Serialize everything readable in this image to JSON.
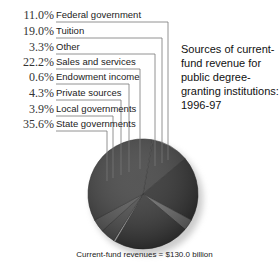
{
  "chart_data": {
    "type": "pie",
    "footer": "Current-fund revenues = $130.0 billion",
    "total": "$130.0 billion",
    "unit": "%",
    "categories": [
      "Federal government",
      "Tuition",
      "Other",
      "Sales and services",
      "Endowment income",
      "Private sources",
      "Local governments",
      "State governments"
    ],
    "values": [
      11.0,
      19.0,
      3.3,
      22.2,
      0.6,
      4.3,
      3.9,
      35.6
    ],
    "labels": [
      "11.0%",
      "19.0%",
      "3.3%",
      "22.2%",
      "0.6%",
      "4.3%",
      "3.9%",
      "35.6%"
    ],
    "legend_position": "left, with leader lines"
  },
  "title": {
    "lines": [
      "Sources of current-",
      "fund revenue for",
      "public degree-",
      "granting institutions:",
      "1996-97"
    ]
  },
  "footer": "Current-fund revenues = $130.0 billion",
  "items": [
    {
      "pct": "11.0%",
      "label": "Federal government"
    },
    {
      "pct": "19.0%",
      "label": "Tuition"
    },
    {
      "pct": "3.3%",
      "label": "Other"
    },
    {
      "pct": "22.2%",
      "label": "Sales and services"
    },
    {
      "pct": "0.6%",
      "label": "Endowment income"
    },
    {
      "pct": "4.3%",
      "label": "Private sources"
    },
    {
      "pct": "3.9%",
      "label": "Local governments"
    },
    {
      "pct": "35.6%",
      "label": "State governments"
    }
  ]
}
